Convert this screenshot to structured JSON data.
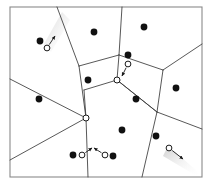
{
  "figure": {
    "width": 212,
    "height": 185,
    "background_color": "#ffffff"
  },
  "frame": {
    "name": "plot-frame",
    "x": 10,
    "y": 7,
    "width": 192,
    "height": 170,
    "stroke_color": "#8a8a8a",
    "stroke_width": 1.1,
    "fill": "none"
  },
  "style": {
    "edge_color": "#3a3a3a",
    "edge_width": 0.85,
    "site_fill": "#111111",
    "site_radius": 3.4,
    "vertex_stroke": "#1a1a1a",
    "vertex_fill": "#ffffff",
    "vertex_radius": 3.0,
    "query_stroke": "#1a1a1a",
    "query_fill": "#ffffff",
    "query_radius": 2.9,
    "arrow_color": "#1a1a1a",
    "arrow_width": 0.9,
    "shadow_color": "#cfcfcf"
  },
  "chart_data": {
    "type": "scatter",
    "xlabel": "",
    "ylabel": "",
    "xlim": [
      10,
      202
    ],
    "ylim": [
      7,
      177
    ],
    "grid": false,
    "legend": null,
    "sites": [
      {
        "id": "s1",
        "x": 40,
        "y": 41
      },
      {
        "id": "s2",
        "x": 94,
        "y": 32
      },
      {
        "id": "s3",
        "x": 144,
        "y": 27
      },
      {
        "id": "s4",
        "x": 128,
        "y": 55
      },
      {
        "id": "s5",
        "x": 88,
        "y": 80
      },
      {
        "id": "s6",
        "x": 39,
        "y": 99
      },
      {
        "id": "s7",
        "x": 176,
        "y": 88
      },
      {
        "id": "s8",
        "x": 136,
        "y": 99
      },
      {
        "id": "s9",
        "x": 122,
        "y": 130
      },
      {
        "id": "s10",
        "x": 156,
        "y": 136
      },
      {
        "id": "s11",
        "x": 73,
        "y": 155
      },
      {
        "id": "s12",
        "x": 113,
        "y": 156
      }
    ],
    "voronoi_vertices": [
      {
        "id": "v1",
        "x": 117,
        "y": 80
      },
      {
        "id": "v2",
        "x": 86,
        "y": 118
      }
    ],
    "query_points": [
      {
        "id": "q1",
        "x": 47,
        "y": 48,
        "dx": 8,
        "dy": -12,
        "note": "moving up-right"
      },
      {
        "id": "q2",
        "x": 128,
        "y": 64,
        "dx": -6,
        "dy": 12,
        "note": "moving down toward vertex"
      },
      {
        "id": "q3",
        "x": 82,
        "y": 155,
        "dx": 10,
        "dy": -7,
        "note": "moving up-right"
      },
      {
        "id": "q4",
        "x": 105,
        "y": 155,
        "dx": -11,
        "dy": -7,
        "note": "moving up-left"
      },
      {
        "id": "q5",
        "x": 169,
        "y": 148,
        "dx": 14,
        "dy": 11,
        "note": "moving down-right"
      }
    ],
    "edges": [
      {
        "from": [
          57,
          7
        ],
        "to": [
          79,
          66
        ]
      },
      {
        "from": [
          79,
          66
        ],
        "to": [
          119,
          55
        ]
      },
      {
        "from": [
          119,
          55
        ],
        "to": [
          117,
          80
        ]
      },
      {
        "from": [
          117,
          80
        ],
        "to": [
          84,
          90
        ]
      },
      {
        "from": [
          84,
          90
        ],
        "to": [
          86,
          118
        ]
      },
      {
        "from": [
          86,
          118
        ],
        "to": [
          79,
          66
        ]
      },
      {
        "from": [
          119,
          55
        ],
        "to": [
          122,
          7
        ]
      },
      {
        "from": [
          119,
          55
        ],
        "to": [
          163,
          70
        ]
      },
      {
        "from": [
          163,
          70
        ],
        "to": [
          202,
          44
        ]
      },
      {
        "from": [
          163,
          70
        ],
        "to": [
          157,
          112
        ]
      },
      {
        "from": [
          157,
          112
        ],
        "to": [
          117,
          80
        ]
      },
      {
        "from": [
          157,
          112
        ],
        "to": [
          202,
          129
        ]
      },
      {
        "from": [
          157,
          112
        ],
        "to": [
          142,
          177
        ]
      },
      {
        "from": [
          86,
          118
        ],
        "to": [
          10,
          79
        ]
      },
      {
        "from": [
          86,
          118
        ],
        "to": [
          10,
          160
        ]
      },
      {
        "from": [
          86,
          118
        ],
        "to": [
          88,
          177
        ]
      },
      {
        "from": [
          117,
          80
        ],
        "to": [
          157,
          112
        ]
      }
    ]
  }
}
